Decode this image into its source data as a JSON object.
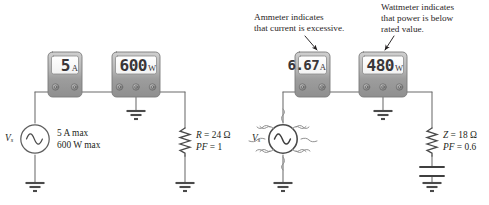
{
  "figure": {
    "background": "#ffffff",
    "ink_color": "#231f20",
    "meter_body_color": "#a8a8a8",
    "meter_screen_color": "#fdfdfd"
  },
  "left_circuit": {
    "source": {
      "name": "Vs",
      "label": "V",
      "label_sub": "s",
      "ratings": [
        "5 A max",
        "600 W max"
      ]
    },
    "ammeter": {
      "value": "5",
      "unit": "A",
      "terminal_count": 2
    },
    "wattmeter": {
      "value": "600",
      "unit": "W",
      "terminal_count": 3
    },
    "load": {
      "line1_var": "R",
      "line1_text": " = 24 Ω",
      "line2_var": "PF",
      "line2_text": " = 1",
      "type": "resistor"
    }
  },
  "right_circuit": {
    "source": {
      "name": "Vs",
      "label": "V",
      "label_sub": "s",
      "stressed": true
    },
    "ammeter": {
      "value": "6.67",
      "unit": "A",
      "terminal_count": 2
    },
    "wattmeter": {
      "value": "480",
      "unit": "W",
      "terminal_count": 3
    },
    "load": {
      "line1_var": "Z",
      "line1_text": " = 18 Ω",
      "line2_var": "PF",
      "line2_text": " = 0.6",
      "type": "resistor-capacitor"
    },
    "annotations": [
      {
        "name": "ammeter-annotation",
        "lines": [
          "Ammeter indicates",
          "that current is excessive."
        ]
      },
      {
        "name": "wattmeter-annotation",
        "lines": [
          "Wattmeter indicates",
          "that power is below",
          "rated value."
        ]
      }
    ]
  }
}
